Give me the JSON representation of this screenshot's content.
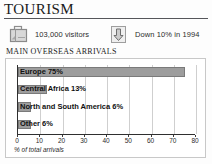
{
  "header": {
    "title": "TOURISM"
  },
  "stats": [
    {
      "icon": "suitcase-icon",
      "label": "103,000 visitors",
      "name": "stat-visitors"
    },
    {
      "icon": "down-arrow-icon",
      "label": "Down 10% in 1994",
      "name": "stat-decline"
    }
  ],
  "section": {
    "heading": "MAIN OVERSEAS ARRIVALS"
  },
  "colors": {
    "bar_fill": "#9d9d9d",
    "bar_stroke": "#7a7a7a",
    "gridline": "#cfcfcf",
    "axis": "#2f2f2f",
    "panel_border": "#c8c8c8"
  },
  "chart_data": {
    "type": "bar",
    "orientation": "horizontal",
    "title": "MAIN OVERSEAS ARRIVALS",
    "xlabel": "% of total arrivals",
    "ylabel": "",
    "xlim": [
      0,
      80
    ],
    "xticks": [
      0,
      10,
      20,
      30,
      40,
      50,
      60,
      70,
      80
    ],
    "grid": true,
    "legend": false,
    "categories": [
      "Europe",
      "Central Africa",
      "North and South America",
      "Other"
    ],
    "values": [
      75,
      13,
      6,
      6
    ],
    "bar_labels": [
      "Europe 75%",
      "Central Africa 13%",
      "North and South America 6%",
      "Other 6%"
    ]
  }
}
